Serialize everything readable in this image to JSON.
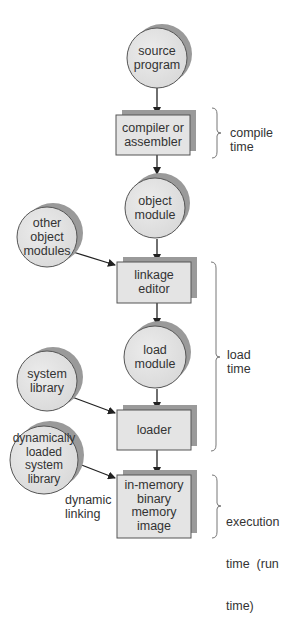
{
  "diagram": {
    "title": "",
    "nodes": [
      {
        "id": "source-program",
        "shape": "circle",
        "label": "source\nprogram",
        "lines": [
          "source",
          "program"
        ]
      },
      {
        "id": "compiler",
        "shape": "box",
        "label": "compiler or\nassembler",
        "lines": [
          "compiler or",
          "assembler"
        ]
      },
      {
        "id": "object-module",
        "shape": "circle",
        "label": "object\nmodule",
        "lines": [
          "object",
          "module"
        ]
      },
      {
        "id": "other-object-modules",
        "shape": "circle",
        "label": "other\nobject\nmodules",
        "lines": [
          "other",
          "object",
          "modules"
        ]
      },
      {
        "id": "linkage-editor",
        "shape": "box",
        "label": "linkage\neditor",
        "lines": [
          "linkage",
          "editor"
        ]
      },
      {
        "id": "load-module",
        "shape": "circle",
        "label": "load\nmodule",
        "lines": [
          "load",
          "module"
        ]
      },
      {
        "id": "system-library",
        "shape": "circle",
        "label": "system\nlibrary",
        "lines": [
          "system",
          "library"
        ]
      },
      {
        "id": "loader",
        "shape": "box",
        "label": "loader",
        "lines": [
          "loader"
        ]
      },
      {
        "id": "dynamically-loaded-system-library",
        "shape": "circle",
        "label": "dynamically\nloaded\nsystem\nlibrary",
        "lines": [
          "dynamically",
          "loaded",
          "system",
          "library"
        ]
      },
      {
        "id": "in-memory-image",
        "shape": "box",
        "label": "in-memory\nbinary\nmemory\nimage",
        "lines": [
          "in-memory",
          "binary",
          "memory",
          "image"
        ]
      }
    ],
    "edges": [
      {
        "from": "source-program",
        "to": "compiler"
      },
      {
        "from": "compiler",
        "to": "object-module"
      },
      {
        "from": "object-module",
        "to": "linkage-editor"
      },
      {
        "from": "other-object-modules",
        "to": "linkage-editor"
      },
      {
        "from": "linkage-editor",
        "to": "load-module"
      },
      {
        "from": "load-module",
        "to": "loader"
      },
      {
        "from": "system-library",
        "to": "loader"
      },
      {
        "from": "loader",
        "to": "in-memory-image"
      },
      {
        "from": "dynamically-loaded-system-library",
        "to": "in-memory-image",
        "label": "dynamic\nlinking"
      }
    ],
    "edge_labels": {
      "dynamic_linking": [
        "dynamic",
        "linking"
      ]
    },
    "phases": [
      {
        "id": "compile-time",
        "lines": [
          "compile",
          "time"
        ],
        "spans": [
          "compiler"
        ]
      },
      {
        "id": "load-time",
        "lines": [
          "load",
          "time"
        ],
        "spans": [
          "linkage-editor",
          "load-module",
          "loader"
        ]
      },
      {
        "id": "execution-time",
        "lines": [
          "execution",
          "time  (run",
          "time)"
        ],
        "spans": [
          "in-memory-image"
        ]
      }
    ],
    "colors": {
      "node_fill": "#e4e4e4",
      "shadow_fill": "#9a9a9a",
      "stroke": "#555555",
      "arrow": "#222222",
      "bracket": "#777777"
    }
  }
}
